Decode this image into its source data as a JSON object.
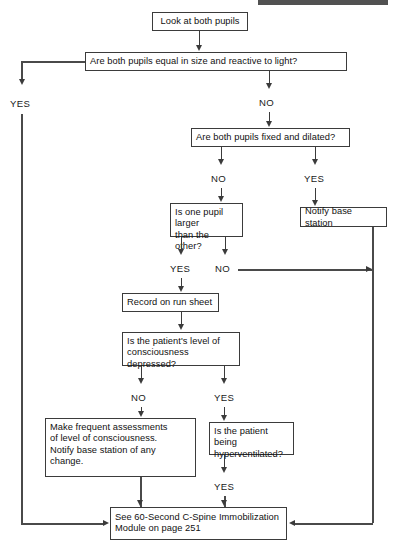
{
  "page": {
    "width": 394,
    "height": 551,
    "background": "#ffffff",
    "line_color": "#3b3b3b",
    "text_color": "#111111"
  },
  "nodes": {
    "look_at_pupils": "Look at both pupils",
    "pupils_equal": "Are both pupils equal in size and reactive to light?",
    "pupils_fixed": "Are both pupils fixed and dilated?",
    "notify_base": "Notify base station",
    "one_pupil_larger": "Is one pupil larger\nthan the other?",
    "record_run_sheet": "Record on run sheet",
    "loc_depressed": "Is the patient's level of\nconsciousness depressed?",
    "make_assessments": "Make frequent assessments\nof level of consciousness.\nNotify base station of any\nchange.",
    "hyperventilated": "Is the patient being\nhyperventilated?",
    "cspine_module": "See 60-Second C-Spine Immobilization\nModule on page 251"
  },
  "branch_labels": {
    "equal_yes": "YES",
    "equal_no": "NO",
    "fixed_no": "NO",
    "fixed_yes": "YES",
    "larger_yes": "YES",
    "larger_no": "NO",
    "loc_no": "NO",
    "loc_yes": "YES",
    "hyperventilated_yes": "YES"
  }
}
